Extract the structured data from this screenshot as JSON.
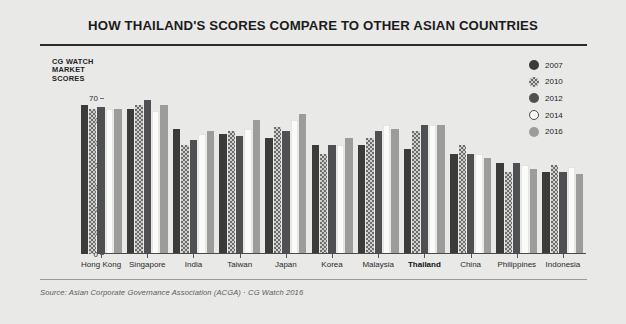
{
  "header": {
    "title": "HOW THAILAND'S SCORES COMPARE TO OTHER ASIAN COUNTRIES"
  },
  "axis_caption": {
    "line1": "CG WATCH",
    "line2": "MARKET",
    "line3": "SCORES"
  },
  "footer": {
    "source": "Source: Asian Corporate Governance Association (ACGA) · CG Watch 2016"
  },
  "legend": {
    "position": "top-right",
    "entries": [
      {
        "label": "2007",
        "color": "#3b3b3c",
        "style": "solid"
      },
      {
        "label": "2010",
        "color": "#cfcfcd",
        "style": "dotted-pattern"
      },
      {
        "label": "2012",
        "color": "#4f5052",
        "style": "solid"
      },
      {
        "label": "2014",
        "color": "#fbfbf9",
        "style": "solid-outlined"
      },
      {
        "label": "2016",
        "color": "#9c9d9b",
        "style": "solid"
      }
    ]
  },
  "chart_data": {
    "type": "bar",
    "title": "HOW THAILAND'S SCORES COMPARE TO OTHER ASIAN COUNTRIES",
    "xlabel": "",
    "ylabel": "CG WATCH MARKET SCORES",
    "ylim": [
      0,
      70
    ],
    "yticks": [
      0,
      10,
      20,
      30,
      40,
      50,
      60,
      70
    ],
    "grid": false,
    "legend_position": "top-right",
    "categories": [
      "Hong Kong",
      "Singapore",
      "India",
      "Taiwan",
      "Japan",
      "Korea",
      "Malaysia",
      "Thailand",
      "China",
      "Philippines",
      "Indonesia"
    ],
    "highlight_category": "Thailand",
    "series": [
      {
        "name": "2007",
        "color": "#3b3b3c",
        "values": [
          67,
          65,
          56,
          54,
          52,
          49,
          49,
          47,
          45,
          41,
          37
        ]
      },
      {
        "name": "2010",
        "color": "#cfcfcd",
        "values": [
          65,
          67,
          49,
          55,
          57,
          45,
          52,
          55,
          49,
          37,
          40
        ]
      },
      {
        "name": "2012",
        "color": "#4f5052",
        "values": [
          66,
          69,
          51,
          53,
          55,
          49,
          55,
          58,
          45,
          41,
          37
        ]
      },
      {
        "name": "2014",
        "color": "#fbfbf9",
        "values": [
          65,
          64,
          54,
          56,
          60,
          49,
          58,
          58,
          45,
          40,
          39
        ]
      },
      {
        "name": "2016",
        "color": "#9c9d9b",
        "values": [
          65,
          67,
          55,
          60,
          63,
          52,
          56,
          58,
          43,
          38,
          36
        ]
      }
    ]
  }
}
